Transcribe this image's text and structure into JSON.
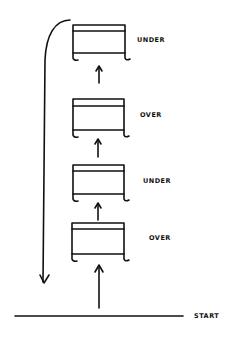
{
  "diagram": {
    "type": "stacked-boxes-flow",
    "start_label": "START",
    "boxes": [
      {
        "label": "UNDER",
        "position": "top"
      },
      {
        "label": "OVER",
        "position": "second"
      },
      {
        "label": "UNDER",
        "position": "third"
      },
      {
        "label": "OVER",
        "position": "bottom"
      }
    ],
    "flow": "upward arrows from START through each box; return loop from top box down on the left side",
    "stroke_color": "#111111",
    "background_color": "#ffffff"
  }
}
